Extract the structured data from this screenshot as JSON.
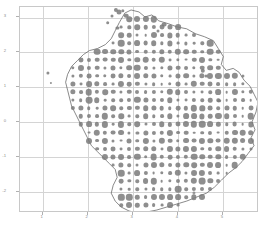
{
  "figure": {
    "title": "",
    "background_color": "#ffffff",
    "grid_color": "#d4d4d4",
    "frame_color": "#c8c8c8",
    "marker_color": "#7a7a7a",
    "outline_color": "#555555"
  },
  "chart_data": {
    "type": "scatter",
    "title": "",
    "xlabel": "",
    "ylabel": "",
    "xlim": [
      0.5,
      5.8
    ],
    "ylim": [
      -2.6,
      3.3
    ],
    "grid": true,
    "legend": "none",
    "xticks": [
      1,
      2,
      3,
      4,
      5
    ],
    "xticklabels": [
      "1",
      "2",
      "3",
      "4",
      "5"
    ],
    "yticks": [
      3,
      2,
      1,
      0,
      -1,
      -2
    ],
    "yticklabels": [
      "3",
      "2",
      "1",
      "0",
      "-1",
      "-2"
    ],
    "marker_shape": "circle",
    "marker_color": "#7a7a7a",
    "size_encoding": "bubble area varies by value",
    "size_range": [
      1.2,
      6.5
    ],
    "grid_spacing": {
      "x": 0.2,
      "y": 0.2
    },
    "overlay": {
      "type": "region-boundary",
      "name": "region-outline",
      "stroke": "#555555",
      "closed": true
    },
    "points": [
      {
        "x": 2.62,
        "y": 3.22,
        "s": 4.2
      },
      {
        "x": 2.7,
        "y": 3.15,
        "s": 5.0
      },
      {
        "x": 2.78,
        "y": 3.2,
        "s": 3.4
      },
      {
        "x": 2.55,
        "y": 3.05,
        "s": 3.0
      },
      {
        "x": 2.86,
        "y": 3.05,
        "s": 4.6
      },
      {
        "x": 2.45,
        "y": 2.85,
        "s": 3.6
      },
      {
        "x": 3.7,
        "y": 2.8,
        "s": 4.8
      },
      {
        "x": 2.66,
        "y": 2.7,
        "s": 3.2
      },
      {
        "x": 3.55,
        "y": 2.62,
        "s": 3.0
      },
      {
        "x": 4.56,
        "y": 1.48,
        "s": 4.4
      },
      {
        "x": 1.12,
        "y": 1.4,
        "s": 3.2
      },
      {
        "x": 4.62,
        "y": 1.32,
        "s": 3.0
      },
      {
        "x": 1.18,
        "y": 1.12,
        "s": 2.2
      },
      {
        "x": 4.92,
        "y": 0.62,
        "s": 3.6
      },
      {
        "x": 4.35,
        "y": -2.02,
        "s": 1.1
      }
    ]
  },
  "outline_path": "M 106,6 L 112,3 L 120,5 L 126,10 L 133,8 L 140,14 L 150,17 L 158,20 L 168,22 L 177,27 L 186,30 L 195,34 L 200,42 L 205,50 L 203,58 L 208,64 L 215,62 L 221,66 L 226,74 L 232,80 L 236,88 L 240,96 L 238,106 L 234,116 L 237,124 L 233,132 L 236,140 L 230,148 L 224,156 L 218,162 L 210,168 L 203,175 L 196,182 L 188,188 L 178,192 L 168,196 L 158,199 L 148,202 L 138,205 L 128,207 L 118,208 L 110,206 L 102,202 L 96,196 L 92,188 L 94,180 L 98,172 L 96,164 L 90,158 L 84,152 L 78,146 L 72,140 L 68,132 L 64,124 L 60,116 L 56,108 L 52,100 L 50,92 L 48,84 L 46,76 L 48,68 L 52,60 L 58,54 L 64,48 L 70,44 L 78,42 L 86,38 L 92,32 L 96,24 L 100,16 Z"
}
